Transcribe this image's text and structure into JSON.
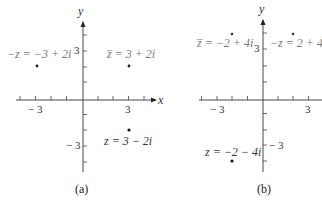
{
  "figure": {
    "panels": [
      {
        "caption": "(a)",
        "x_axis_label": "x",
        "y_axis_label": "y",
        "x_tick_labels": [
          "− 3",
          "3"
        ],
        "y_tick_labels": [
          "3",
          "− 3"
        ],
        "points": [
          {
            "name": "-z",
            "label": "−z = −3 + 2i",
            "x": -3,
            "y": 2
          },
          {
            "name": "z-bar",
            "label": "z̅ = 3 + 2i",
            "x": 3,
            "y": 2
          },
          {
            "name": "z",
            "label": "z = 3 − 2i",
            "x": 3,
            "y": -2
          }
        ]
      },
      {
        "caption": "(b)",
        "x_axis_label": "",
        "y_axis_label": "y",
        "x_tick_labels": [
          "− 3",
          "3"
        ],
        "y_tick_labels": [
          "3",
          "− 3"
        ],
        "points": [
          {
            "name": "z-bar",
            "label": "z̅ = −2 + 4i",
            "x": -2,
            "y": 4
          },
          {
            "name": "-z",
            "label": "−z = 2 + 4",
            "x": 2,
            "y": 4
          },
          {
            "name": "z",
            "label": "z = −2 − 4i",
            "x": -2,
            "y": -4
          }
        ]
      }
    ]
  }
}
